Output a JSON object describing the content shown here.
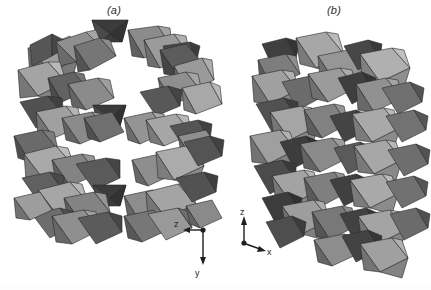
{
  "figure": {
    "type": "crystal-structure-polyhedral-diagram",
    "background_color": "#ffffff",
    "width": 431,
    "height": 290,
    "panels": [
      {
        "id": "a",
        "label": "(a)",
        "description": "Polyhedral framework projection showing open channels between corner- and edge-sharing octahedra",
        "axes": {
          "origin_marker": "filled-dot",
          "axis_1": {
            "label": "z",
            "direction": "left"
          },
          "axis_2": {
            "label": "y",
            "direction": "down"
          },
          "out_of_plane": "x"
        }
      },
      {
        "id": "b",
        "label": "(b)",
        "description": "Polyhedral framework projection showing densely packed edge-sharing octahedra",
        "axes": {
          "origin_marker": "filled-dot",
          "axis_1": {
            "label": "z",
            "direction": "up"
          },
          "axis_2": {
            "label": "x",
            "direction": "right-down"
          },
          "out_of_plane": "y"
        }
      }
    ]
  },
  "colors": {
    "face_dark": "#3b3b3b",
    "face_mid_dark": "#585858",
    "face_mid": "#6f6f6f",
    "face_mid_light": "#8c8c8c",
    "face_light": "#a9a9a9",
    "face_lightest": "#bdbdbd",
    "edge": "#2a2a2a",
    "text": "#2b2b2b",
    "background": "#ffffff"
  },
  "axis_labels": {
    "a_horizontal": "z",
    "a_vertical": "y",
    "b_vertical": "z",
    "b_horizontal": "x"
  }
}
